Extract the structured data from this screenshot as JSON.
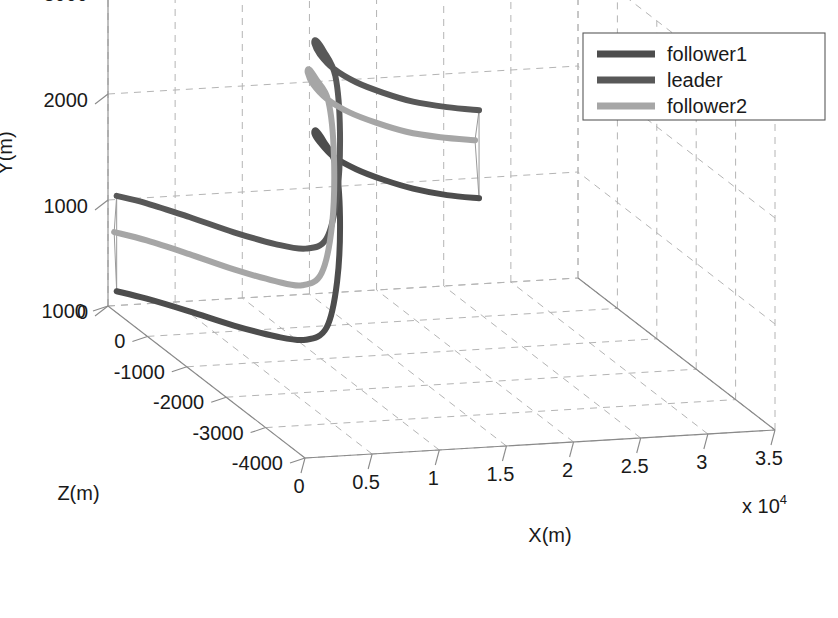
{
  "chart_data": {
    "type": "line",
    "title": "",
    "projection": "3d",
    "xlabel": "X(m)",
    "ylabel": "Y(m)",
    "zlabel": "Z(m)",
    "x_multiplier": "x 10",
    "x_multiplier_exp": "4",
    "xticks": [
      "0",
      "0.5",
      "1",
      "1.5",
      "2",
      "2.5",
      "3",
      "3.5"
    ],
    "xtickvals": [
      0,
      5000,
      10000,
      15000,
      20000,
      25000,
      30000,
      35000
    ],
    "yticks": [
      "0",
      "1000",
      "2000",
      "3000"
    ],
    "ytickvals": [
      0,
      1000,
      2000,
      3000
    ],
    "zticks": [
      "-4000",
      "-3000",
      "-2000",
      "-1000",
      "0",
      "1000"
    ],
    "ztickvals": [
      -4000,
      -3000,
      -2000,
      -1000,
      0,
      1000
    ],
    "xlim": [
      0,
      35000
    ],
    "ylim": [
      0,
      3000
    ],
    "zlim": [
      -4000,
      1000
    ],
    "grid": true,
    "legend_position": "top-right",
    "series": [
      {
        "name": "follower1",
        "color": "#4d4d4d",
        "width": 6,
        "points": [
          [
            500,
            150,
            950
          ],
          [
            2000,
            140,
            700
          ],
          [
            4000,
            120,
            300
          ],
          [
            6000,
            100,
            -150
          ],
          [
            8000,
            90,
            -520
          ],
          [
            9500,
            120,
            -780
          ],
          [
            10700,
            260,
            -900
          ],
          [
            11400,
            700,
            -930
          ],
          [
            11700,
            1300,
            -900
          ],
          [
            11800,
            1750,
            -750
          ],
          [
            12100,
            1850,
            -350
          ],
          [
            13000,
            1800,
            150
          ],
          [
            14500,
            1600,
            700
          ],
          [
            16500,
            1350,
            1250
          ],
          [
            19000,
            1050,
            1750
          ],
          [
            22000,
            780,
            2200
          ],
          [
            25000,
            560,
            2550
          ],
          [
            28000,
            380,
            2800
          ],
          [
            31000,
            250,
            2960
          ],
          [
            33500,
            190,
            3000
          ]
        ]
      },
      {
        "name": "leader",
        "color": "#585858",
        "width": 6,
        "points": [
          [
            500,
            1050,
            950
          ],
          [
            2000,
            1040,
            700
          ],
          [
            4000,
            1010,
            300
          ],
          [
            6000,
            980,
            -150
          ],
          [
            8000,
            960,
            -520
          ],
          [
            9500,
            980,
            -780
          ],
          [
            10700,
            1100,
            -900
          ],
          [
            11400,
            1520,
            -930
          ],
          [
            11700,
            2100,
            -900
          ],
          [
            11800,
            2580,
            -750
          ],
          [
            12100,
            2700,
            -350
          ],
          [
            13000,
            2650,
            150
          ],
          [
            14500,
            2450,
            700
          ],
          [
            16500,
            2180,
            1250
          ],
          [
            19000,
            1880,
            1750
          ],
          [
            22000,
            1600,
            2200
          ],
          [
            25000,
            1380,
            2550
          ],
          [
            28000,
            1200,
            2800
          ],
          [
            31000,
            1080,
            2960
          ],
          [
            33500,
            1020,
            3000
          ]
        ]
      },
      {
        "name": "follower2",
        "color": "#a6a6a6",
        "width": 6,
        "points": [
          [
            400,
            700,
            980
          ],
          [
            2000,
            690,
            700
          ],
          [
            4000,
            660,
            300
          ],
          [
            6000,
            630,
            -150
          ],
          [
            8000,
            610,
            -520
          ],
          [
            9200,
            640,
            -790
          ],
          [
            10300,
            780,
            -910
          ],
          [
            11000,
            1250,
            -940
          ],
          [
            11250,
            1880,
            -900
          ],
          [
            11300,
            2350,
            -740
          ],
          [
            11600,
            2430,
            -340
          ],
          [
            12500,
            2380,
            150
          ],
          [
            14000,
            2180,
            700
          ],
          [
            16000,
            1900,
            1250
          ],
          [
            18500,
            1600,
            1750
          ],
          [
            21500,
            1320,
            2200
          ],
          [
            24500,
            1100,
            2550
          ],
          [
            27500,
            920,
            2800
          ],
          [
            30500,
            800,
            2960
          ],
          [
            33200,
            740,
            3000
          ]
        ]
      }
    ],
    "legend": [
      {
        "label": "follower1",
        "color": "#4d4d4d"
      },
      {
        "label": "leader",
        "color": "#585858"
      },
      {
        "label": "follower2",
        "color": "#a6a6a6"
      }
    ]
  }
}
